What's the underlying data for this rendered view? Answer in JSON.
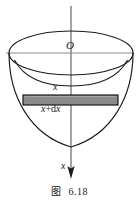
{
  "figure": {
    "caption_label": "图",
    "caption_number": "6.18",
    "labels": {
      "origin": "O",
      "x_upper": "x",
      "x_plus_dx_var": "x",
      "x_plus_dx_rest": "+d",
      "x_plus_dx_var2": "x",
      "x_plus_dx_full": "x+dx",
      "x_axis": "x"
    },
    "colors": {
      "stroke": "#1a1a1a",
      "axis": "#6f6f6f",
      "slab_fill": "#8a8a8a",
      "slab_stroke": "#1a1a1a",
      "background": "#ffffff"
    },
    "geometry": {
      "origin_x": 71,
      "origin_y": 53,
      "top_ellipse_rx": 62,
      "top_ellipse_ry": 22,
      "paraboloid_bottom_y": 147,
      "slab_left_x": 23,
      "slab_right_x": 118,
      "slab_top_y": 95,
      "slab_bottom_y": 105,
      "axis_top_y": 6,
      "axis_arrow_tip_y": 179
    }
  }
}
